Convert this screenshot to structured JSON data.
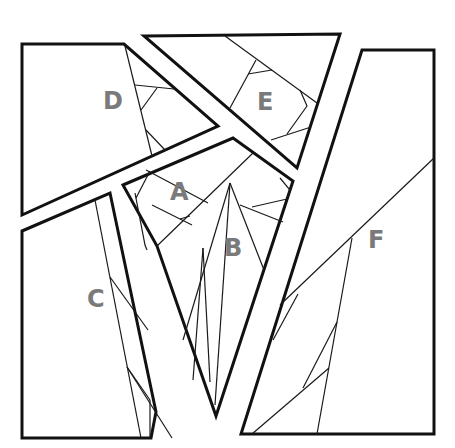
{
  "diagram": {
    "title": "",
    "colors": {
      "outline": "#111111",
      "inner_lines": "#1a1a1a",
      "label": "#7a7a7a",
      "background": "#ffffff"
    },
    "pieces": [
      {
        "id": "D",
        "label": "D"
      },
      {
        "id": "E",
        "label": "E"
      },
      {
        "id": "A",
        "label": "A"
      },
      {
        "id": "B",
        "label": "B"
      },
      {
        "id": "C",
        "label": "C"
      },
      {
        "id": "F",
        "label": "F"
      }
    ]
  }
}
